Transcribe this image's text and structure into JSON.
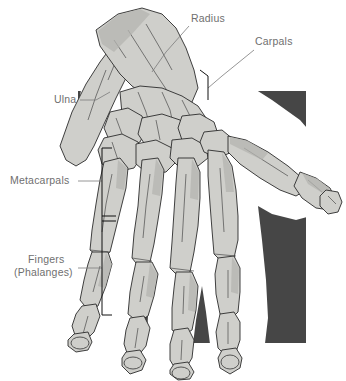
{
  "figure": {
    "type": "anatomical-illustration",
    "background_color": "#ffffff",
    "panel_color": "#464646",
    "bone_fill_color": "#cfcfcb",
    "bone_outline_color": "#2b2b2b",
    "label_color": "#6f6f6f",
    "leader_color": "#7b7b7b",
    "bracket_color": "#111111"
  },
  "labels": {
    "radius": "Radius",
    "carpals": "Carpals",
    "ulna": "Ulna",
    "metacarpals": "Metacarpals",
    "fingers_line1": "Fingers",
    "fingers_line2": "(Phalanges)"
  },
  "panel": {
    "x": 78,
    "y": 91,
    "width": 228,
    "height": 252
  },
  "annotations": [
    {
      "name": "radius",
      "text": "Radius",
      "text_x": 191,
      "text_y": 22,
      "anchor": "start"
    },
    {
      "name": "carpals",
      "text": "Carpals",
      "text_x": 255,
      "text_y": 45,
      "anchor": "start"
    },
    {
      "name": "ulna",
      "text": "Ulna",
      "text_x": 54,
      "text_y": 103,
      "anchor": "start"
    },
    {
      "name": "metacarpals",
      "text": "Metacarpals",
      "text_x": 10,
      "text_y": 184,
      "anchor": "start"
    },
    {
      "name": "fingers",
      "text": "Fingers",
      "text_x": 27,
      "text_y": 263,
      "anchor": "start"
    },
    {
      "name": "phalanges",
      "text": "(Phalanges)",
      "text_x": 14,
      "text_y": 275,
      "anchor": "start"
    }
  ]
}
